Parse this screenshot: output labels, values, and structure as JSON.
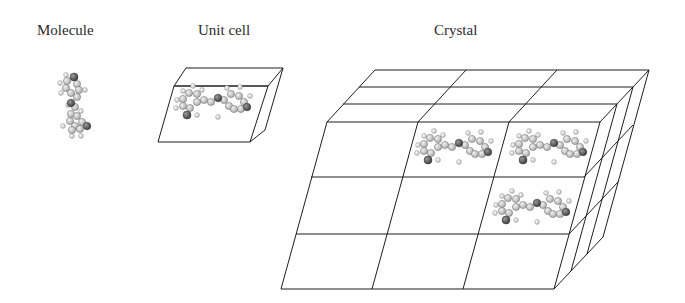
{
  "labels": {
    "molecule": "Molecule",
    "unit_cell": "Unit cell",
    "crystal": "Crystal"
  },
  "colors": {
    "line": "#1e1e1e",
    "atom_carbon": "#c4c4c4",
    "atom_hetero": "#555555",
    "atom_hydrogen": "#e0e0e0",
    "atom_stroke": "#666666",
    "background": "#ffffff"
  },
  "panels": [
    {
      "id": "molecule",
      "title": "Molecule",
      "contents": "single molecule, ball-and-stick"
    },
    {
      "id": "unit_cell",
      "title": "Unit cell",
      "contents": "parallelepiped containing one molecule"
    },
    {
      "id": "crystal",
      "title": "Crystal",
      "contents": "3x3 grid of unit cells, 3 layers deep; molecules shown in 3 cells"
    }
  ],
  "crystal_grid": {
    "columns": 3,
    "rows": 3,
    "depth_layers": 3,
    "molecules_in_cells": [
      [
        0,
        1
      ],
      [
        0,
        2
      ],
      [
        1,
        2
      ]
    ]
  }
}
